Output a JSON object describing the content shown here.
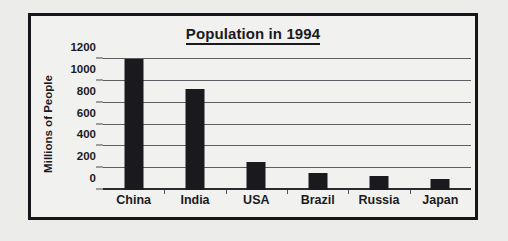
{
  "chart_data": {
    "type": "bar",
    "title": "Population in 1994",
    "xlabel": "",
    "ylabel": "Millions of People",
    "categories": [
      "China",
      "India",
      "USA",
      "Brazil",
      "Russia",
      "Japan"
    ],
    "values": [
      1200,
      925,
      260,
      155,
      130,
      100
    ],
    "series": [
      {
        "name": "Population",
        "values": [
          1200,
          925,
          260,
          155,
          130,
          100
        ]
      }
    ],
    "ylim": [
      0,
      1200
    ],
    "yticks": [
      0,
      200,
      400,
      600,
      800,
      1000,
      1200
    ],
    "ytick_labels": [
      "0",
      "200",
      "400",
      "600",
      "800",
      "1000",
      "1200"
    ],
    "grid": true,
    "legend": false,
    "legend_position": "none",
    "bar_color": "#1a1a1e",
    "title_underlined": true,
    "frame_color": "#16161a",
    "background_color": "#f1f1f0"
  }
}
